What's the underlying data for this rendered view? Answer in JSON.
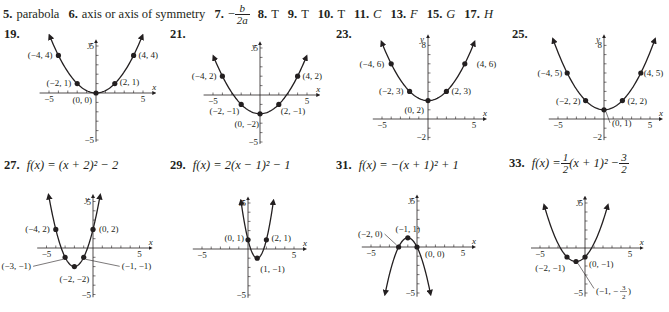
{
  "answers": [
    {
      "num": "5.",
      "text": "parabola"
    },
    {
      "num": "6.",
      "text": "axis or axis of symmetry"
    },
    {
      "num": "7.",
      "prefix": "−",
      "frac_num": "b",
      "frac_den": "2a"
    },
    {
      "num": "8.",
      "text": "T"
    },
    {
      "num": "9.",
      "text": "T"
    },
    {
      "num": "10.",
      "text": "T"
    },
    {
      "num": "11.",
      "text": "C",
      "italic": true
    },
    {
      "num": "13.",
      "text": "F",
      "italic": true
    },
    {
      "num": "15.",
      "text": "G",
      "italic": true
    },
    {
      "num": "17.",
      "text": "H",
      "italic": true
    }
  ],
  "problems": {
    "p19": {
      "label": "19."
    },
    "p21": {
      "label": "21."
    },
    "p23": {
      "label": "23."
    },
    "p25": {
      "label": "25."
    },
    "p27": {
      "label": "27.",
      "func": "f(x) = (x + 2)² − 2"
    },
    "p29": {
      "label": "29.",
      "func": "f(x) = 2(x − 1)² − 1"
    },
    "p31": {
      "label": "31.",
      "func": "f(x) = −(x + 1)² + 1"
    },
    "p33": {
      "label": "33.",
      "func_prefix": "f(x) = ",
      "func_a_num": "1",
      "func_a_den": "2",
      "func_mid": "(x + 1)² − ",
      "func_c_num": "3",
      "func_c_den": "2"
    }
  },
  "chart_data": [
    {
      "id": "19",
      "type": "line",
      "title": "19.",
      "equation": "y = (1/4)x^2",
      "a": 0.25,
      "h": 0,
      "k": 0,
      "xlabel": "x",
      "ylabel": "y",
      "xlim": [
        -5,
        5
      ],
      "ylim": [
        -5,
        5
      ],
      "x_tick_labels": [
        "-5",
        "5"
      ],
      "y_tick_labels": [
        "5",
        "-5"
      ],
      "origin_px": [
        96,
        93
      ],
      "px_per_unit": 9.4,
      "x_range_px": [
        -6.0,
        6.2
      ],
      "y_top": 5.5,
      "y_bottom": -5.2,
      "curve_x": [
        -4.9,
        4.9
      ],
      "points": [
        {
          "x": -4,
          "y": 4,
          "label": "(−4, 4)",
          "lx": -6,
          "ly": 3,
          "anchor": "end"
        },
        {
          "x": -2,
          "y": 1,
          "label": "(−2, 1)",
          "lx": -6,
          "ly": 2,
          "anchor": "end"
        },
        {
          "x": 0,
          "y": 0,
          "label": "(0, 0)",
          "lx": -4,
          "ly": 10,
          "anchor": "end"
        },
        {
          "x": 2,
          "y": 1,
          "label": "(2, 1)",
          "lx": 5,
          "ly": 1,
          "anchor": "start"
        },
        {
          "x": 4,
          "y": 4,
          "label": "(4, 4)",
          "lx": 5,
          "ly": 3,
          "anchor": "start"
        }
      ]
    },
    {
      "id": "21",
      "type": "line",
      "title": "21.",
      "equation": "y = (1/4)x^2 - 2",
      "a": 0.25,
      "h": 0,
      "k": -2,
      "xlabel": "x",
      "ylabel": "y",
      "xlim": [
        -5,
        5
      ],
      "ylim": [
        -5,
        5
      ],
      "x_tick_labels": [
        "-5",
        "5"
      ],
      "y_tick_labels": [
        "5",
        "-5"
      ],
      "origin_px": [
        260,
        95
      ],
      "px_per_unit": 9.4,
      "x_range_px": [
        -6.0,
        6.2
      ],
      "y_top": 5.5,
      "y_bottom": -5.2,
      "curve_x": [
        -4.9,
        4.9
      ],
      "points": [
        {
          "x": -4,
          "y": 2,
          "label": "(−4, 2)",
          "lx": -6,
          "ly": 3,
          "anchor": "end"
        },
        {
          "x": -2,
          "y": -1,
          "label": "(−2, −1)",
          "lx": -2,
          "ly": 10,
          "anchor": "end"
        },
        {
          "x": 0,
          "y": -2,
          "label": "(0, −2)",
          "lx": -1,
          "ly": 13,
          "anchor": "end"
        },
        {
          "x": 2,
          "y": -1,
          "label": "(2, −1)",
          "lx": 2,
          "ly": 10,
          "anchor": "start"
        },
        {
          "x": 4,
          "y": 2,
          "label": "(4, 2)",
          "lx": 5,
          "ly": 3,
          "anchor": "start"
        }
      ]
    },
    {
      "id": "23",
      "type": "line",
      "title": "23.",
      "equation": "y = (1/4)x^2 + 2",
      "a": 0.25,
      "h": 0,
      "k": 2,
      "xlabel": "x",
      "ylabel": "y",
      "xlim": [
        -5,
        5
      ],
      "ylim": [
        -2,
        8
      ],
      "x_tick_labels": [
        "-5",
        "5"
      ],
      "y_tick_labels": [
        "8",
        "-2"
      ],
      "origin_px": [
        428,
        119
      ],
      "px_per_unit": 9.2,
      "x_range_px": [
        -6.0,
        6.2
      ],
      "y_top": 9.0,
      "y_bottom": -2.3,
      "curve_x": [
        -5.0,
        5.0
      ],
      "points": [
        {
          "x": -4,
          "y": 6,
          "label": "(−4, 6)",
          "lx": -7,
          "ly": 3,
          "anchor": "end"
        },
        {
          "x": -2,
          "y": 3,
          "label": "(−2, 3)",
          "lx": -6,
          "ly": 3,
          "anchor": "end"
        },
        {
          "x": 0,
          "y": 2,
          "label": "(0, 2)",
          "lx": -4,
          "ly": 12,
          "anchor": "end"
        },
        {
          "x": 2,
          "y": 3,
          "label": "(2, 3)",
          "lx": 5,
          "ly": 3,
          "anchor": "start"
        },
        {
          "x": 4,
          "y": 6,
          "label": "(4, 6)",
          "lx": 12,
          "ly": 3,
          "anchor": "start"
        }
      ]
    },
    {
      "id": "25",
      "type": "line",
      "title": "25.",
      "equation": "y = (1/4)x^2 + 1",
      "a": 0.25,
      "h": 0,
      "k": 1,
      "xlabel": "x",
      "ylabel": "y",
      "xlim": [
        -5,
        5
      ],
      "ylim": [
        -2,
        8
      ],
      "x_tick_labels": [
        "-5",
        "5"
      ],
      "y_tick_labels": [
        "8",
        "-2"
      ],
      "origin_px": [
        604,
        119
      ],
      "px_per_unit": 9.2,
      "x_range_px": [
        -6.0,
        6.2
      ],
      "y_top": 9.0,
      "y_bottom": -2.3,
      "curve_x": [
        -5.5,
        5.5
      ],
      "points": [
        {
          "x": -4,
          "y": 5,
          "label": "(−4, 5)",
          "lx": -5,
          "ly": 3,
          "anchor": "end"
        },
        {
          "x": -2,
          "y": 2,
          "label": "(−2, 2)",
          "lx": -5,
          "ly": 3,
          "anchor": "end"
        },
        {
          "x": 0,
          "y": 1,
          "label": "(0, 1)",
          "lx": 8,
          "ly": 16,
          "anchor": "start",
          "leader": true
        },
        {
          "x": 2,
          "y": 2,
          "label": "(2, 2)",
          "lx": 5,
          "ly": 3,
          "anchor": "start"
        },
        {
          "x": 4,
          "y": 5,
          "label": "(4, 5)",
          "lx": 3,
          "ly": 3,
          "anchor": "start"
        }
      ]
    },
    {
      "id": "27",
      "type": "line",
      "title": "27. f(x) = (x + 2)^2 - 2",
      "equation": "f(x) = (x + 2)^2 - 2",
      "a": 1,
      "h": -2,
      "k": -2,
      "xlabel": "x",
      "ylabel": "y",
      "xlim": [
        -5,
        5
      ],
      "ylim": [
        -5,
        5
      ],
      "x_tick_labels": [
        "-5",
        "5"
      ],
      "y_tick_labels": [
        "5",
        "-5"
      ],
      "origin_px": [
        93,
        248
      ],
      "px_per_unit": 9.3,
      "x_range_px": [
        -6.0,
        6.2
      ],
      "y_top": 5.6,
      "y_bottom": -5.3,
      "curve_x": [
        -4.75,
        0.75
      ],
      "points": [
        {
          "x": -4,
          "y": 2,
          "label": "(−4, 2)",
          "lx": -6,
          "ly": 3,
          "anchor": "end"
        },
        {
          "x": -3,
          "y": -1,
          "label": "(−3, −1)",
          "lx": -34,
          "ly": 12,
          "anchor": "end",
          "leader": true
        },
        {
          "x": -2,
          "y": -2,
          "label": "(−2, −2)",
          "lx": 0,
          "ly": 15,
          "anchor": "middle"
        },
        {
          "x": -1,
          "y": -1,
          "label": "(−1, −1)",
          "lx": 38,
          "ly": 12,
          "anchor": "start",
          "leader": true
        },
        {
          "x": 0,
          "y": 2,
          "label": "(0, 2)",
          "lx": 6,
          "ly": 3,
          "anchor": "start"
        }
      ]
    },
    {
      "id": "29",
      "type": "line",
      "title": "29. f(x) = 2(x - 1)^2 - 1",
      "equation": "f(x) = 2(x - 1)^2 - 1",
      "a": 2,
      "h": 1,
      "k": -1,
      "xlabel": "x",
      "ylabel": "y",
      "xlim": [
        -5,
        5
      ],
      "ylim": [
        -5,
        5
      ],
      "x_tick_labels": [
        "-5",
        "5"
      ],
      "y_tick_labels": [
        "5",
        "-5"
      ],
      "origin_px": [
        248,
        249
      ],
      "px_per_unit": 9.2,
      "x_range_px": [
        -6.0,
        6.2
      ],
      "y_top": 5.5,
      "y_bottom": -5.3,
      "curve_x": [
        -0.75,
        2.75
      ],
      "points": [
        {
          "x": 0,
          "y": 1,
          "label": "(0, 1)",
          "lx": -4,
          "ly": 1,
          "anchor": "end"
        },
        {
          "x": 1,
          "y": -1,
          "label": "(1, −1)",
          "lx": 3,
          "ly": 14,
          "anchor": "start"
        },
        {
          "x": 2,
          "y": 1,
          "label": "(2, 1)",
          "lx": 5,
          "ly": 1,
          "anchor": "start"
        }
      ]
    },
    {
      "id": "31",
      "type": "line",
      "title": "31. f(x) = -(x + 1)^2 + 1",
      "equation": "f(x) = -(x + 1)^2 + 1",
      "a": -1,
      "h": -1,
      "k": 1,
      "xlabel": "x",
      "ylabel": "y",
      "xlim": [
        -5,
        5
      ],
      "ylim": [
        -5,
        5
      ],
      "x_tick_labels": [
        "-5",
        "5"
      ],
      "y_tick_labels": [
        "5",
        "-5"
      ],
      "origin_px": [
        417,
        247
      ],
      "px_per_unit": 9.2,
      "x_range_px": [
        -6.0,
        6.2
      ],
      "y_top": 5.5,
      "y_bottom": -5.4,
      "curve_x": [
        -3.45,
        1.45
      ],
      "points": [
        {
          "x": -2,
          "y": 0,
          "label": "(−2, 0)",
          "lx": -16,
          "ly": -10,
          "anchor": "end",
          "leader": true
        },
        {
          "x": -1,
          "y": 1,
          "label": "(−1, 1)",
          "lx": 0,
          "ly": -6,
          "anchor": "middle"
        },
        {
          "x": 0,
          "y": 0,
          "label": "(0, 0)",
          "lx": 8,
          "ly": 10,
          "anchor": "start"
        }
      ]
    },
    {
      "id": "33",
      "type": "line",
      "title": "33. f(x) = (1/2)(x + 1)^2 - 3/2",
      "equation": "f(x) = (1/2)(x + 1)^2 - 3/2",
      "a": 0.5,
      "h": -1,
      "k": -1.5,
      "xlabel": "x",
      "ylabel": "y",
      "xlim": [
        -5,
        5
      ],
      "ylim": [
        -5,
        5
      ],
      "x_tick_labels": [
        "-5",
        "5"
      ],
      "y_tick_labels": [
        "5",
        "-5"
      ],
      "origin_px": [
        585,
        248
      ],
      "px_per_unit": 9.0,
      "x_range_px": [
        -6.0,
        6.3
      ],
      "y_top": 5.6,
      "y_bottom": -5.4,
      "curve_x": [
        -4.5,
        2.5
      ],
      "points": [
        {
          "x": -2,
          "y": -1,
          "label": "(−2, −1)",
          "lx": -2,
          "ly": 14,
          "anchor": "end"
        },
        {
          "x": -1,
          "y": -1.5,
          "label": "(−1, −3/2)",
          "lx": 20,
          "ly": 30,
          "anchor": "start",
          "leader": true,
          "fraction_label": true
        },
        {
          "x": 0,
          "y": -1,
          "label": "(0, −1)",
          "lx": 4,
          "ly": 10,
          "anchor": "start"
        }
      ]
    }
  ]
}
